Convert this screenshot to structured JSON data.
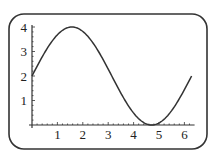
{
  "chart_data": {
    "type": "line",
    "title": "",
    "xlabel": "",
    "ylabel": "",
    "function": "2 + 2 sin(x)",
    "xlim": [
      0,
      6.2832
    ],
    "ylim": [
      0,
      4
    ],
    "grid": false,
    "legend": null,
    "x_ticks": [
      "1",
      "2",
      "3",
      "4",
      "5",
      "6"
    ],
    "y_ticks": [
      "1",
      "2",
      "3",
      "4"
    ],
    "series": [
      {
        "name": "y",
        "x": [
          0,
          0.5,
          1,
          1.5,
          1.5708,
          2,
          2.5,
          3,
          3.5,
          4,
          4.5,
          4.7124,
          5,
          5.5,
          6,
          6.2832
        ],
        "values": [
          2.0,
          2.96,
          3.68,
          4.0,
          4.0,
          3.82,
          3.2,
          2.28,
          1.3,
          0.49,
          0.04,
          0.0,
          0.08,
          0.59,
          1.44,
          2.0
        ]
      }
    ],
    "colors": {
      "line": "#333333",
      "frame": "#333333"
    }
  }
}
